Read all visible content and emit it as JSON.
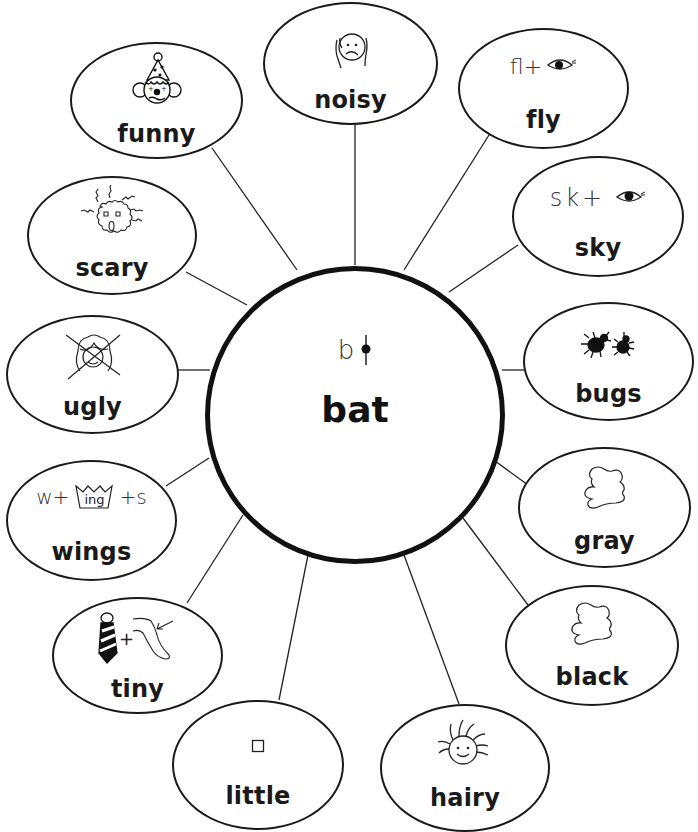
{
  "center": {
    "word": "bat",
    "symbol_text": "b",
    "symbol": "b-with-tack-letter"
  },
  "nodes": [
    {
      "id": "funny",
      "label": "funny",
      "icon": "clown-icon"
    },
    {
      "id": "noisy",
      "label": "noisy",
      "icon": "covered-ears-face-icon"
    },
    {
      "id": "fly",
      "label": "fly",
      "symbol_text": "fl+",
      "icon": "eye-icon"
    },
    {
      "id": "sky",
      "label": "sky",
      "symbol_text": "sk+",
      "icon": "eye-icon"
    },
    {
      "id": "bugs",
      "label": "bugs",
      "icon": "bugs-icon"
    },
    {
      "id": "gray",
      "label": "gray",
      "icon": "blob-icon"
    },
    {
      "id": "black",
      "label": "black",
      "icon": "blob-icon"
    },
    {
      "id": "hairy",
      "label": "hairy",
      "icon": "hairy-face-icon"
    },
    {
      "id": "little",
      "label": "little",
      "icon": "small-square-icon"
    },
    {
      "id": "tiny",
      "label": "tiny",
      "icon": "tie-plus-knee-icon"
    },
    {
      "id": "wings",
      "label": "wings",
      "symbol_prefix": "w+",
      "symbol_crown": "ing",
      "symbol_suffix": "+s",
      "icon": "crown-icon"
    },
    {
      "id": "ugly",
      "label": "ugly",
      "icon": "crossed-out-pretty-face-icon"
    },
    {
      "id": "scary",
      "label": "scary",
      "icon": "scary-face-icon"
    }
  ],
  "colors": {
    "ink": "#1a1a1a",
    "background": "#ffffff"
  }
}
